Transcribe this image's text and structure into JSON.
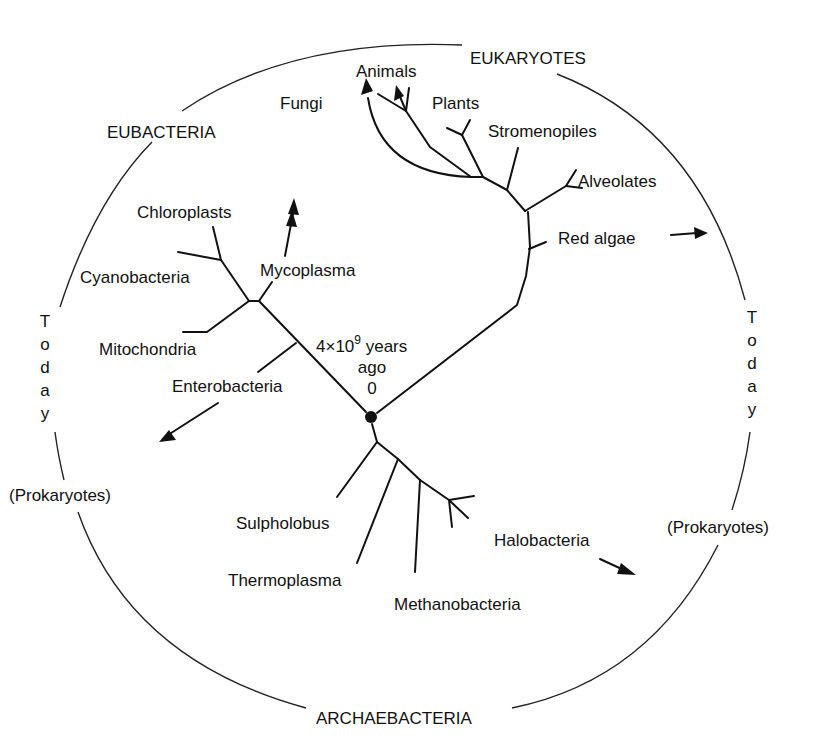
{
  "diagram": {
    "origin": {
      "line1": "4×10",
      "exponent": "9",
      "line1_suffix": " years",
      "line2": "ago",
      "line3": "0"
    },
    "domains": {
      "eukaryotes": "EUKARYOTES",
      "eubacteria": "EUBACTERIA",
      "archaebacteria": "ARCHAEBACTERIA"
    },
    "periphery": {
      "today_left": [
        "T",
        "o",
        "d",
        "a",
        "y"
      ],
      "today_right": [
        "T",
        "o",
        "d",
        "a",
        "y"
      ],
      "prokaryotes_left": "(Prokaryotes)",
      "prokaryotes_right": "(Prokaryotes)"
    },
    "eukaryote_taxa": {
      "animals": "Animals",
      "fungi": "Fungi",
      "plants": "Plants",
      "stromenopiles": "Stromenopiles",
      "alveolates": "Alveolates",
      "red_algae": "Red algae"
    },
    "eubacteria_taxa": {
      "chloroplasts": "Chloroplasts",
      "cyanobacteria": "Cyanobacteria",
      "mycoplasma": "Mycoplasma",
      "mitochondria": "Mitochondria",
      "enterobacteria": "Enterobacteria"
    },
    "archaebacteria_taxa": {
      "sulpholobus": "Sulpholobus",
      "thermoplasma": "Thermoplasma",
      "methanobacteria": "Methanobacteria",
      "halobacteria": "Halobacteria"
    },
    "colors": {
      "line": "#111111",
      "background": "#ffffff"
    }
  }
}
